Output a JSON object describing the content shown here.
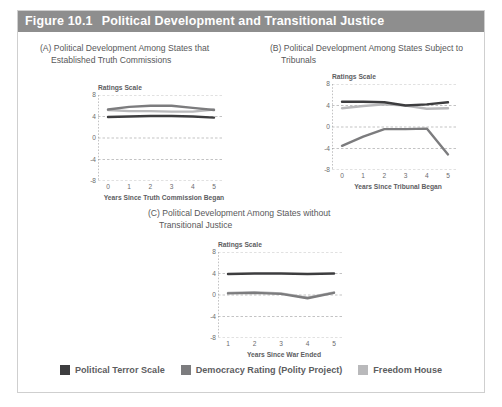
{
  "figure": {
    "number": "Figure 10.1",
    "title": "Political Development and Transitional Justice"
  },
  "panels": {
    "a": {
      "label": "(A)",
      "caption_line1": "(A) Political Development Among States that",
      "caption_line2": "Established Truth Commissions"
    },
    "b": {
      "label": "(B)",
      "caption_line1": "(B) Political Development Among States Subject to",
      "caption_line2": "Tribunals"
    },
    "c": {
      "label": "(C)",
      "caption_line1": "(C) Political Development Among States without",
      "caption_line2": "Transitional Justice"
    }
  },
  "legend": {
    "items": [
      {
        "label": "Political Terror Scale",
        "color": "#3d3d3f"
      },
      {
        "label": "Democracy Rating (Polity Project)",
        "color": "#7c7c7e"
      },
      {
        "label": "Freedom House",
        "color": "#b9b9bb"
      }
    ]
  },
  "axis_common": {
    "ylabel": "Ratings Scale",
    "yticks": [
      "8",
      "4",
      "0",
      "-4",
      "-8"
    ],
    "ymin": -8,
    "ymax": 8
  },
  "chart_data": [
    {
      "type": "line",
      "panel": "A",
      "title": "(A) Political Development Among States that Established Truth Commissions",
      "xlabel": "Years Since Truth Commission Began",
      "ylabel": "Ratings Scale",
      "x": [
        0,
        1,
        2,
        3,
        4,
        5
      ],
      "xticks": [
        "0",
        "1",
        "2",
        "3",
        "4",
        "5"
      ],
      "ylim": [
        -8,
        8
      ],
      "yticks": [
        8,
        4,
        0,
        -4,
        -8
      ],
      "grid": "dashed-horizontal",
      "legend_position": "bottom-shared",
      "series": [
        {
          "name": "Political Terror Scale",
          "color": "#3d3d3f",
          "values": [
            3.9,
            4.0,
            4.1,
            4.1,
            4.0,
            3.8
          ]
        },
        {
          "name": "Democracy Rating (Polity Project)",
          "color": "#7c7c7e",
          "values": [
            5.3,
            5.8,
            6.0,
            6.0,
            5.6,
            5.2
          ]
        },
        {
          "name": "Freedom House",
          "color": "#b9b9bb",
          "values": [
            5.2,
            5.0,
            5.0,
            4.9,
            4.9,
            5.3
          ]
        }
      ]
    },
    {
      "type": "line",
      "panel": "B",
      "title": "(B) Political Development Among States Subject to Tribunals",
      "xlabel": "Years Since Tribunal Began",
      "ylabel": "Ratings Scale",
      "x": [
        0,
        1,
        2,
        3,
        4,
        5
      ],
      "xticks": [
        "0",
        "1",
        "2",
        "3",
        "4",
        "5"
      ],
      "ylim": [
        -8,
        8
      ],
      "yticks": [
        8,
        4,
        0,
        -4,
        -8
      ],
      "grid": "dashed-horizontal",
      "legend_position": "bottom-shared",
      "series": [
        {
          "name": "Political Terror Scale",
          "color": "#3d3d3f",
          "values": [
            4.7,
            4.7,
            4.6,
            4.0,
            4.2,
            4.6
          ]
        },
        {
          "name": "Democracy Rating (Polity Project)",
          "color": "#7c7c7e",
          "values": [
            -3.5,
            -1.8,
            -0.4,
            -0.4,
            -0.3,
            -5.1
          ]
        },
        {
          "name": "Freedom House",
          "color": "#b9b9bb",
          "values": [
            3.5,
            3.9,
            4.2,
            4.0,
            3.4,
            3.5
          ]
        }
      ]
    },
    {
      "type": "line",
      "panel": "C",
      "title": "(C) Political Development Among States without Transitional Justice",
      "xlabel": "Years Since War Ended",
      "ylabel": "Ratings Scale",
      "x": [
        1,
        2,
        3,
        4,
        5
      ],
      "xticks": [
        "1",
        "2",
        "3",
        "4",
        "5"
      ],
      "ylim": [
        -8,
        8
      ],
      "yticks": [
        8,
        4,
        0,
        -4,
        -8
      ],
      "grid": "dashed-horizontal",
      "legend_position": "bottom-shared",
      "series": [
        {
          "name": "Political Terror Scale",
          "color": "#3d3d3f",
          "values": [
            3.9,
            4.0,
            4.0,
            3.9,
            4.0
          ]
        },
        {
          "name": "Democracy Rating (Polity Project)",
          "color": "#7c7c7e",
          "values": [
            0.3,
            0.4,
            0.2,
            -0.6,
            0.4
          ]
        },
        {
          "name": "Freedom House",
          "color": "#b9b9bb",
          "values": [
            0.4,
            0.5,
            0.3,
            -0.5,
            0.5
          ]
        }
      ]
    }
  ]
}
